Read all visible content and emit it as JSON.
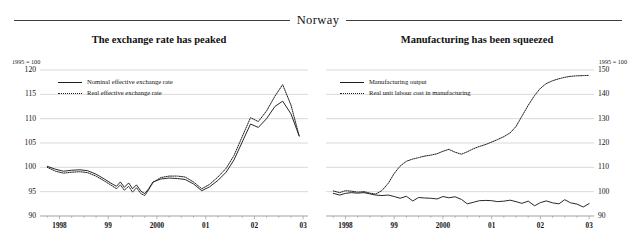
{
  "banner": {
    "country": "Norway"
  },
  "panels": [
    {
      "id": "exchange-rate",
      "title": "The exchange rate has peaked",
      "unit_note": "1995 = 100",
      "axis_side": "left"
    },
    {
      "id": "manufacturing",
      "title": "Manufacturing has been squeezed",
      "unit_note": "1995 = 100",
      "axis_side": "right"
    }
  ],
  "chart_data": [
    {
      "type": "line",
      "title": "The exchange rate has peaked",
      "subtitle": "Norway",
      "xlabel": "",
      "ylabel": "1995 = 100",
      "unit_note": "1995 = 100",
      "grid": true,
      "legend_position": "top-left",
      "axis_side": "left",
      "xlim": [
        1997.6,
        2003.1
      ],
      "ylim": [
        90,
        120
      ],
      "yticks": [
        90,
        95,
        100,
        105,
        110,
        115,
        120
      ],
      "xticks": [
        1998,
        1999,
        2000,
        2001,
        2002,
        2003
      ],
      "xticklabels": [
        "1998",
        "99",
        "2000",
        "01",
        "02",
        "03"
      ],
      "series": [
        {
          "name": "Nominal effective exchange rate",
          "style": "solid",
          "color": "#1e1e1e",
          "x": [
            1997.75,
            1997.92,
            1998.08,
            1998.25,
            1998.42,
            1998.58,
            1998.75,
            1998.92,
            1999.08,
            1999.17,
            1999.25,
            1999.33,
            1999.42,
            1999.5,
            1999.58,
            1999.67,
            1999.75,
            1999.83,
            1999.92,
            2000.08,
            2000.25,
            2000.42,
            2000.58,
            2000.75,
            2000.92,
            2001.08,
            2001.25,
            2001.42,
            2001.58,
            2001.75,
            2001.92,
            2002.08,
            2002.25,
            2002.42,
            2002.58,
            2002.75,
            2002.92
          ],
          "y": [
            100.2,
            99.6,
            99.2,
            99.4,
            99.5,
            99.3,
            98.6,
            97.6,
            96.6,
            96.1,
            97.0,
            95.9,
            96.8,
            95.6,
            96.4,
            95.1,
            94.6,
            95.6,
            97.0,
            97.6,
            97.8,
            97.7,
            97.5,
            96.6,
            95.2,
            96.0,
            97.3,
            99.0,
            101.5,
            105.2,
            108.9,
            108.2,
            110.0,
            112.5,
            113.6,
            111.0,
            106.4
          ]
        },
        {
          "name": "Real effective exchange rate",
          "style": "dotted",
          "color": "#1e1e1e",
          "x": [
            1997.75,
            1997.92,
            1998.08,
            1998.25,
            1998.42,
            1998.58,
            1998.75,
            1998.92,
            1999.08,
            1999.17,
            1999.25,
            1999.33,
            1999.42,
            1999.5,
            1999.58,
            1999.67,
            1999.75,
            1999.83,
            1999.92,
            2000.08,
            2000.25,
            2000.42,
            2000.58,
            2000.75,
            2000.92,
            2001.08,
            2001.25,
            2001.42,
            2001.58,
            2001.75,
            2001.92,
            2002.08,
            2002.25,
            2002.42,
            2002.58,
            2002.75,
            2002.92
          ],
          "y": [
            100.0,
            99.2,
            98.8,
            99.0,
            99.1,
            98.9,
            98.2,
            97.2,
            96.2,
            95.6,
            96.4,
            95.3,
            96.1,
            94.9,
            95.8,
            94.6,
            94.2,
            95.4,
            96.9,
            97.9,
            98.2,
            98.2,
            98.0,
            97.0,
            95.6,
            96.5,
            98.0,
            99.8,
            102.4,
            106.3,
            110.2,
            109.4,
            111.6,
            114.6,
            117.0,
            112.8,
            106.4
          ]
        }
      ]
    },
    {
      "type": "line",
      "title": "Manufacturing has been squeezed",
      "subtitle": "Norway",
      "xlabel": "",
      "ylabel": "1995 = 100",
      "unit_note": "1995 = 100",
      "grid": true,
      "legend_position": "top-left",
      "axis_side": "right",
      "xlim": [
        1997.6,
        2003.1
      ],
      "ylim": [
        90,
        150
      ],
      "yticks": [
        90,
        100,
        110,
        120,
        130,
        140,
        150
      ],
      "xticks": [
        1998,
        1999,
        2000,
        2001,
        2002,
        2003
      ],
      "xticklabels": [
        "1998",
        "99",
        "2000",
        "01",
        "02",
        "03"
      ],
      "series": [
        {
          "name": "Manufacturing output",
          "style": "solid",
          "color": "#1e1e1e",
          "x": [
            1997.75,
            1997.88,
            1998.0,
            1998.12,
            1998.25,
            1998.38,
            1998.5,
            1998.62,
            1998.75,
            1998.88,
            1999.0,
            1999.12,
            1999.25,
            1999.38,
            1999.5,
            1999.62,
            1999.75,
            1999.88,
            2000.0,
            2000.12,
            2000.25,
            2000.38,
            2000.5,
            2000.62,
            2000.75,
            2000.88,
            2001.0,
            2001.12,
            2001.25,
            2001.38,
            2001.5,
            2001.62,
            2001.75,
            2001.88,
            2002.0,
            2002.12,
            2002.25,
            2002.38,
            2002.5,
            2002.62,
            2002.75,
            2002.88,
            2003.0
          ],
          "y": [
            99.3,
            98.6,
            99.3,
            99.6,
            99.4,
            99.6,
            99.1,
            98.6,
            98.4,
            98.6,
            98.0,
            97.3,
            98.1,
            96.2,
            97.6,
            97.4,
            97.3,
            97.0,
            98.0,
            97.5,
            97.9,
            96.8,
            95.0,
            95.6,
            96.3,
            96.4,
            96.3,
            95.9,
            96.1,
            96.5,
            95.9,
            95.2,
            96.1,
            94.2,
            95.5,
            96.2,
            95.4,
            95.0,
            96.7,
            95.4,
            94.9,
            93.7,
            95.1
          ]
        },
        {
          "name": "Real unit labour cost in manufacturing",
          "style": "dotted",
          "color": "#1e1e1e",
          "x": [
            1997.75,
            1997.88,
            1998.0,
            1998.12,
            1998.25,
            1998.38,
            1998.5,
            1998.62,
            1998.75,
            1998.88,
            1999.0,
            1999.12,
            1999.25,
            1999.38,
            1999.5,
            1999.62,
            1999.75,
            1999.88,
            2000.0,
            2000.12,
            2000.25,
            2000.38,
            2000.5,
            2000.62,
            2000.75,
            2000.88,
            2001.0,
            2001.12,
            2001.25,
            2001.38,
            2001.5,
            2001.62,
            2001.75,
            2001.88,
            2002.0,
            2002.12,
            2002.25,
            2002.38,
            2002.5,
            2002.62,
            2002.75,
            2002.88,
            2003.0
          ],
          "y": [
            100.3,
            99.6,
            100.4,
            100.2,
            99.8,
            100.0,
            99.4,
            99.0,
            100.5,
            103.5,
            107.5,
            110.5,
            112.5,
            113.4,
            114.0,
            114.6,
            115.0,
            115.6,
            116.6,
            117.4,
            116.2,
            115.4,
            116.4,
            117.6,
            118.6,
            119.4,
            120.4,
            121.4,
            122.6,
            124.2,
            126.8,
            131.0,
            135.5,
            139.5,
            142.5,
            144.4,
            145.6,
            146.4,
            147.0,
            147.4,
            147.6,
            147.7,
            147.8
          ]
        }
      ]
    }
  ]
}
